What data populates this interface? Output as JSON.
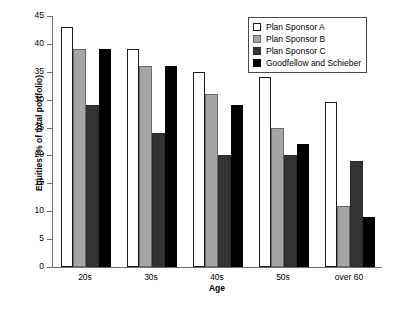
{
  "chart_data": {
    "type": "bar",
    "title": "",
    "xlabel": "Age",
    "ylabel": "Equities (% of total portfolio)",
    "categories": [
      "20s",
      "30s",
      "40s",
      "50s",
      "over 60"
    ],
    "series": [
      {
        "name": "Plan Sponsor A",
        "color": "#ffffff",
        "values": [
          43,
          39,
          35,
          34,
          29.5
        ]
      },
      {
        "name": "Plan Sponsor B",
        "color": "#a5a5a5",
        "values": [
          39,
          36,
          31,
          25,
          11
        ]
      },
      {
        "name": "Plan Sponsor C",
        "color": "#333333",
        "values": [
          29,
          24,
          20,
          20,
          19
        ]
      },
      {
        "name": "Goodfellow and Schieber",
        "color": "#000000",
        "values": [
          39,
          36,
          29,
          22,
          9
        ]
      }
    ],
    "ylim": [
      0,
      45
    ],
    "ytick_labels": [
      "45",
      "40",
      "35",
      "30",
      "25",
      "20",
      "15",
      "10",
      "5",
      "0"
    ],
    "ytick_values": [
      45,
      40,
      35,
      30,
      25,
      20,
      15,
      10,
      5,
      0
    ],
    "grid": false,
    "legend_position": "top-right"
  },
  "caption": {
    "remnant": ""
  }
}
